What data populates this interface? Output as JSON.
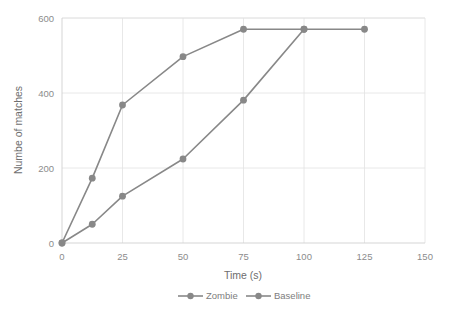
{
  "chart_data": {
    "type": "line",
    "title": "",
    "xlabel": "Time (s)",
    "ylabel": "Numbe of matches",
    "xlim": [
      0,
      150
    ],
    "ylim": [
      0,
      600
    ],
    "xticks": [
      0,
      25,
      50,
      75,
      100,
      125,
      150
    ],
    "yticks": [
      0,
      200,
      400,
      600
    ],
    "xtick_labels": [
      "0",
      "25",
      "50",
      "75",
      "100",
      "125",
      "150"
    ],
    "ytick_labels": [
      "0",
      "200",
      "400",
      "600"
    ],
    "grid": "horizontal-and-vertical",
    "legend_position": "bottom-center",
    "series": [
      {
        "name": "Zombie",
        "color": "#888888",
        "marker": "circle",
        "x": [
          0,
          12.5,
          25,
          50,
          75,
          100,
          125
        ],
        "values": [
          0,
          173,
          368,
          497,
          570,
          570,
          570
        ]
      },
      {
        "name": "Baseline",
        "color": "#888888",
        "marker": "circle",
        "x": [
          0,
          12.5,
          25,
          50,
          75,
          100
        ],
        "values": [
          0,
          50,
          125,
          224,
          381,
          570
        ]
      }
    ]
  },
  "legend": {
    "items": [
      {
        "label": "Zombie"
      },
      {
        "label": "Baseline"
      }
    ]
  },
  "colors": {
    "series": "#888888",
    "gridline": "#e2e2e2",
    "axis": "#d0d0d0",
    "text": "#7d7d7d",
    "background": "#ffffff"
  }
}
